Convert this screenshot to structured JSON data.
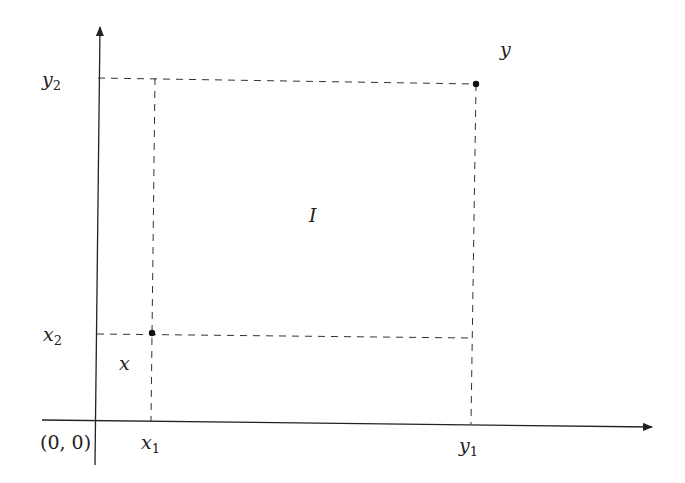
{
  "diagram": {
    "type": "coordinate-interval-diagram",
    "colors": {
      "background": "#ffffff",
      "ink": "#222222",
      "dash": "#333333"
    },
    "axes": {
      "origin_label": "(0, 0)",
      "x_axis": {
        "from": [
          42,
          420
        ],
        "to": [
          652,
          427
        ]
      },
      "y_axis": {
        "from": [
          95,
          465
        ],
        "to": [
          100,
          27
        ]
      }
    },
    "points": [
      {
        "name": "x",
        "label": "x",
        "coords": [
          152,
          333
        ]
      },
      {
        "name": "y",
        "label": "y",
        "coords": [
          476,
          84
        ]
      }
    ],
    "labels": {
      "x_point": "x",
      "y_point": "y",
      "region": "I",
      "x1": {
        "base": "x",
        "sub": "1"
      },
      "x2": {
        "base": "x",
        "sub": "2"
      },
      "y1": {
        "base": "y",
        "sub": "1"
      },
      "y2": {
        "base": "y",
        "sub": "2"
      }
    },
    "dashed_lines": [
      {
        "name": "y2-horizontal",
        "from": [
          98,
          78
        ],
        "to": [
          476,
          84
        ]
      },
      {
        "name": "x1-vertical",
        "from": [
          155,
          78
        ],
        "to": [
          151,
          421
        ]
      },
      {
        "name": "x2-horizontal",
        "from": [
          97,
          334
        ],
        "to": [
          472,
          338
        ]
      },
      {
        "name": "y1-vertical",
        "from": [
          476,
          84
        ],
        "to": [
          471,
          424
        ]
      }
    ]
  }
}
